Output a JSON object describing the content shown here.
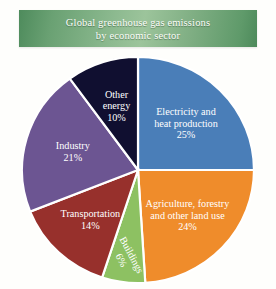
{
  "title": {
    "line1": "Global greenhouse gas emissions",
    "line2": "by economic sector",
    "banner_color_left": "#4e8b5c",
    "banner_color_center": "#9cc49b",
    "text_color": "#fdfdfa"
  },
  "chart_data": {
    "type": "pie",
    "title": "Global greenhouse gas emissions by economic sector",
    "subtitle": "",
    "xlabel": "",
    "ylabel": "",
    "grid": false,
    "legend_position": "none",
    "labels_inside_slices": true,
    "start_angle_deg": 0,
    "direction": "clockwise",
    "units": "percent",
    "total": 100,
    "categories": [
      "Electricity and heat production",
      "Agriculture, forestry and other land use",
      "Buildings",
      "Transportation",
      "Industry",
      "Other energy"
    ],
    "values": [
      25,
      24,
      6,
      14,
      21,
      10
    ],
    "colors": [
      "#4a7eb8",
      "#ef8c2b",
      "#8dc162",
      "#97302c",
      "#6c5592",
      "#100f30"
    ],
    "slices": [
      {
        "name": "Electricity and heat production",
        "label_lines": [
          "Electricity and",
          "heat production"
        ],
        "value": 25,
        "value_label": "25%",
        "color": "#4a7eb8",
        "label_rotation_deg": 0
      },
      {
        "name": "Agriculture, forestry and other land use",
        "label_lines": [
          "Agriculture, forestry",
          "and other land use"
        ],
        "value": 24,
        "value_label": "24%",
        "color": "#ef8c2b",
        "label_rotation_deg": 0
      },
      {
        "name": "Buildings",
        "label_lines": [
          "Buildings"
        ],
        "value": 6,
        "value_label": "6%",
        "color": "#8dc162",
        "label_rotation_deg": 62
      },
      {
        "name": "Transportation",
        "label_lines": [
          "Transportation"
        ],
        "value": 14,
        "value_label": "14%",
        "color": "#97302c",
        "label_rotation_deg": 0
      },
      {
        "name": "Industry",
        "label_lines": [
          "Industry"
        ],
        "value": 21,
        "value_label": "21%",
        "color": "#6c5592",
        "label_rotation_deg": 0
      },
      {
        "name": "Other energy",
        "label_lines": [
          "Other",
          "energy"
        ],
        "value": 10,
        "value_label": "10%",
        "color": "#100f30",
        "label_rotation_deg": 0
      }
    ]
  }
}
